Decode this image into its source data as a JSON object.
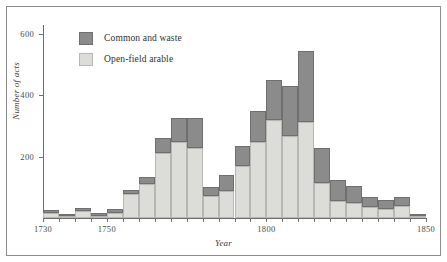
{
  "chart_data": {
    "type": "bar",
    "stacked": true,
    "title": "",
    "xlabel": "Year",
    "ylabel": "Number of acts",
    "xlim": [
      1730,
      1850
    ],
    "ylim": [
      0,
      630
    ],
    "ytick_values": [
      200,
      400,
      600
    ],
    "ytick_labels": [
      "200",
      "400",
      "600"
    ],
    "xtick_values": [
      1730,
      1750,
      1800,
      1850
    ],
    "xtick_labels": [
      "1730",
      "1750",
      "1800",
      "1850"
    ],
    "grid": false,
    "legend_position": "top-left",
    "bin_width": 5,
    "categories": [
      "1730",
      "1735",
      "1740",
      "1745",
      "1750",
      "1755",
      "1760",
      "1765",
      "1770",
      "1775",
      "1780",
      "1785",
      "1790",
      "1795",
      "1800",
      "1805",
      "1810",
      "1815",
      "1820",
      "1825",
      "1830",
      "1835",
      "1840",
      "1845"
    ],
    "series": [
      {
        "name": "Open-field arable",
        "color": "#dcdcd8",
        "values": [
          18,
          8,
          22,
          8,
          18,
          78,
          112,
          212,
          248,
          228,
          72,
          88,
          170,
          248,
          320,
          268,
          312,
          115,
          55,
          48,
          35,
          30,
          38,
          5
        ]
      },
      {
        "name": "Common and waste",
        "color": "#8b8b8b",
        "values": [
          8,
          6,
          10,
          8,
          10,
          15,
          22,
          50,
          78,
          98,
          28,
          52,
          66,
          100,
          130,
          162,
          232,
          112,
          68,
          58,
          33,
          30,
          32,
          3
        ]
      }
    ],
    "totals": [
      26,
      14,
      32,
      16,
      28,
      93,
      134,
      262,
      326,
      326,
      100,
      140,
      236,
      348,
      450,
      430,
      544,
      227,
      123,
      106,
      68,
      60,
      70,
      8
    ],
    "legend_entries": [
      {
        "label": "Common and waste",
        "color": "#8b8b8b"
      },
      {
        "label": "Open-field arable",
        "color": "#dcdcd8"
      }
    ]
  },
  "axes": {
    "ylabel": "Number of acts",
    "xlabel": "Year",
    "yticks": [
      {
        "label": "600",
        "value": 600
      },
      {
        "label": "400",
        "value": 400
      },
      {
        "label": "200",
        "value": 200
      }
    ],
    "xticks": [
      {
        "label": "1730",
        "value": 1730
      },
      {
        "label": "1750",
        "value": 1750
      },
      {
        "label": "1800",
        "value": 1800
      },
      {
        "label": "1850",
        "value": 1850
      }
    ]
  },
  "legend": {
    "items": [
      {
        "label": "Common and waste",
        "swatch": "common-waste-swatch"
      },
      {
        "label": "Open-field arable",
        "swatch": "open-field-swatch"
      }
    ]
  },
  "colors": {
    "common_and_waste": "#8b8b8b",
    "open_field_arable": "#dcdcd8",
    "axis": "#6f6f6f",
    "frame": "#8d8d8d",
    "background": "#ffffff"
  }
}
